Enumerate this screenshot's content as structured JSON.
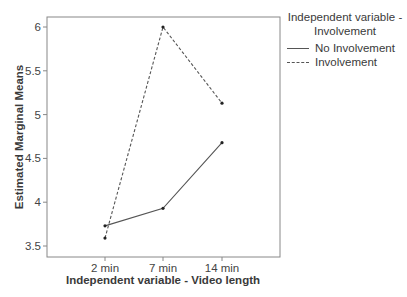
{
  "chart_data": {
    "type": "line",
    "title": "",
    "xlabel": "Independent variable - Video length",
    "ylabel": "Estimated Marginal Means",
    "categories": [
      "2 min",
      "7 min",
      "14 min"
    ],
    "series": [
      {
        "name": "No Involvement",
        "style": "solid",
        "values": [
          3.73,
          3.93,
          4.68
        ]
      },
      {
        "name": "Involvement",
        "style": "dashed",
        "values": [
          3.59,
          6.0,
          5.13
        ]
      }
    ],
    "yticks": [
      3.5,
      4,
      4.5,
      5,
      5.5,
      6
    ],
    "ytick_labels": [
      "3.5",
      "4",
      "4.5",
      "5",
      "5.5",
      "6"
    ],
    "ylim": [
      3.38,
      6.12
    ],
    "grid": false,
    "legend": {
      "title": "Independent variable - Involvement",
      "title_lines": [
        "Independent variable -",
        "Involvement"
      ],
      "position": "right",
      "entries": [
        "No Involvement",
        "Involvement"
      ]
    }
  },
  "colors": {
    "line": "#555555",
    "axis": "#777777",
    "text": "#333333"
  }
}
